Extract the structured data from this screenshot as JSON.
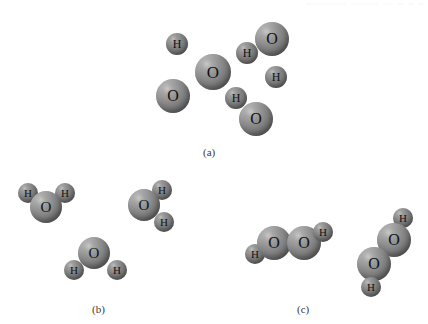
{
  "figure": {
    "background_color": "#ffffff",
    "width": 428,
    "height": 324,
    "oxygen_color": "#7c7c7c",
    "hydrogen_color": "#767676",
    "label_color": "#3a3a3a"
  },
  "panels": [
    {
      "id": "a",
      "label": "(a)",
      "label_x": 203,
      "label_y": 146,
      "description": "Mixture of separate oxygen and hydrogen atoms",
      "atoms": [
        {
          "element": "H",
          "x": 177,
          "y": 44,
          "r": 11
        },
        {
          "element": "O",
          "x": 272,
          "y": 39,
          "r": 17
        },
        {
          "element": "H",
          "x": 247,
          "y": 53,
          "r": 11
        },
        {
          "element": "O",
          "x": 213,
          "y": 72,
          "r": 18
        },
        {
          "element": "H",
          "x": 276,
          "y": 77,
          "r": 11
        },
        {
          "element": "O",
          "x": 173,
          "y": 96,
          "r": 17
        },
        {
          "element": "H",
          "x": 236,
          "y": 98,
          "r": 11
        },
        {
          "element": "O",
          "x": 256,
          "y": 119,
          "r": 17
        }
      ]
    },
    {
      "id": "b",
      "label": "(b)",
      "label_x": 92,
      "label_y": 303,
      "description": "Water molecules",
      "molecules": [
        {
          "formula": "H2O",
          "atoms": [
            {
              "element": "H",
              "x": 28,
              "y": 193,
              "r": 10
            },
            {
              "element": "H",
              "x": 65,
              "y": 193,
              "r": 10
            },
            {
              "element": "O",
              "x": 46,
              "y": 207,
              "r": 16
            }
          ]
        },
        {
          "formula": "H2O",
          "atoms": [
            {
              "element": "H",
              "x": 162,
              "y": 190,
              "r": 10
            },
            {
              "element": "O",
              "x": 144,
              "y": 205,
              "r": 16
            },
            {
              "element": "H",
              "x": 164,
              "y": 222,
              "r": 10
            }
          ]
        },
        {
          "formula": "H2O",
          "atoms": [
            {
              "element": "O",
              "x": 94,
              "y": 253,
              "r": 16
            },
            {
              "element": "H",
              "x": 74,
              "y": 270,
              "r": 10
            },
            {
              "element": "H",
              "x": 117,
              "y": 270,
              "r": 10
            }
          ]
        }
      ]
    },
    {
      "id": "c",
      "label": "(c)",
      "label_x": 297,
      "label_y": 303,
      "description": "Hydrogen peroxide molecules",
      "molecules": [
        {
          "formula": "H2O2",
          "atoms": [
            {
              "element": "H",
              "x": 255,
              "y": 254,
              "r": 10
            },
            {
              "element": "O",
              "x": 274,
              "y": 243,
              "r": 17
            },
            {
              "element": "O",
              "x": 304,
              "y": 243,
              "r": 17
            },
            {
              "element": "H",
              "x": 323,
              "y": 232,
              "r": 10
            }
          ]
        },
        {
          "formula": "H2O2",
          "atoms": [
            {
              "element": "H",
              "x": 403,
              "y": 218,
              "r": 10
            },
            {
              "element": "O",
              "x": 394,
              "y": 240,
              "r": 17
            },
            {
              "element": "O",
              "x": 374,
              "y": 264,
              "r": 17
            },
            {
              "element": "H",
              "x": 371,
              "y": 287,
              "r": 10
            }
          ]
        }
      ]
    }
  ],
  "scan_artifacts": [
    {
      "x": 306,
      "y": 3,
      "width": 40,
      "height": 2
    },
    {
      "x": 352,
      "y": 3,
      "width": 26,
      "height": 2
    },
    {
      "x": 384,
      "y": 3,
      "width": 9,
      "height": 2
    },
    {
      "x": 397,
      "y": 3,
      "width": 7,
      "height": 2
    },
    {
      "x": 408,
      "y": 3,
      "width": 6,
      "height": 2
    },
    {
      "x": 418,
      "y": 3,
      "width": 7,
      "height": 2
    }
  ]
}
